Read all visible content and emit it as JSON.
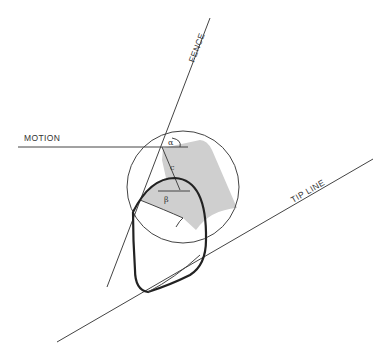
{
  "diagram": {
    "labels": {
      "fence": "FENCE",
      "motion": "MOTION",
      "tip_line": "TIP LINE",
      "alpha": "α",
      "beta": "β",
      "c": "c"
    },
    "colors": {
      "line": "#444444",
      "curve": "#222222",
      "shaded_region": "#cfcfcf",
      "background": "#ffffff"
    }
  }
}
